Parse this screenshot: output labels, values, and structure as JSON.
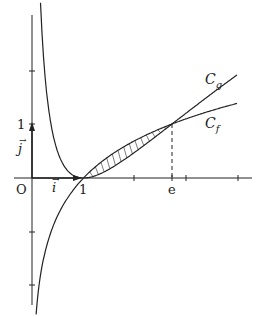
{
  "figure": {
    "origin_label": "O",
    "x_unit_label": "1",
    "y_unit_label": "1",
    "x_e_label": "e",
    "i_vector_label": "i",
    "j_vector_label": "j",
    "curve_g_label": "C",
    "curve_g_sub": "g",
    "curve_f_label": "C",
    "curve_f_sub": "f",
    "colors": {
      "stroke": "#222222",
      "background": "#ffffff"
    }
  },
  "chart_data": {
    "type": "line",
    "title": "",
    "xlabel": "",
    "ylabel": "",
    "xlim": [
      -0.4,
      4.2
    ],
    "ylim": [
      -2.3,
      3.0
    ],
    "x_ticks": [
      1,
      2,
      3,
      4
    ],
    "y_ticks": [
      -2,
      -1,
      1,
      2
    ],
    "annotations": [
      "O",
      "1",
      "e",
      "i",
      "j",
      "C_g",
      "C_f"
    ],
    "series": [
      {
        "name": "C_f",
        "description": "f(x) = ln x",
        "points": [
          [
            0.08,
            -2.3
          ],
          [
            0.2,
            -1.6
          ],
          [
            0.5,
            -0.69
          ],
          [
            1,
            0
          ],
          [
            2,
            0.69
          ],
          [
            2.718,
            1
          ],
          [
            4,
            1.39
          ]
        ]
      },
      {
        "name": "C_g",
        "description": "g(x) = (ln x)^2",
        "points": [
          [
            0.16,
            3.0
          ],
          [
            0.3,
            1.45
          ],
          [
            0.5,
            0.48
          ],
          [
            1,
            0
          ],
          [
            2,
            0.48
          ],
          [
            2.718,
            1
          ],
          [
            4,
            1.92
          ]
        ]
      }
    ],
    "shaded_region": {
      "between": [
        "C_f",
        "C_g"
      ],
      "x_from": 1,
      "x_to": 2.718,
      "style": "hatched"
    },
    "dashed_lines": [
      {
        "from": [
          2.718,
          0
        ],
        "to": [
          2.718,
          1
        ]
      }
    ]
  }
}
